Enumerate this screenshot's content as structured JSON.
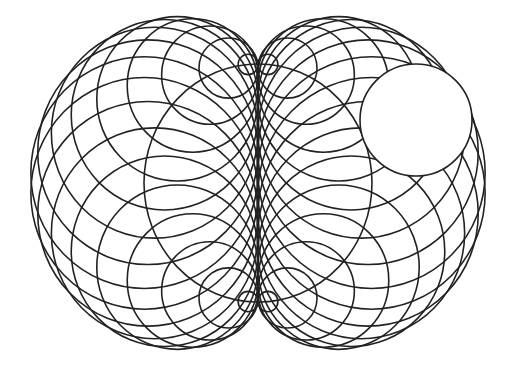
{
  "figure": {
    "type": "nephroid-circle-envelope",
    "canvas": {
      "width": 514,
      "height": 374,
      "background": "#ffffff"
    },
    "stroke_color": "#222222",
    "base_circle": {
      "cx": 258,
      "cy": 183,
      "rx": 114,
      "ry": 119
    },
    "generating_circles": {
      "count": 36,
      "start_angle_deg": 5
    },
    "highlight_circle": {
      "cx": 416,
      "cy": 120,
      "r": 56,
      "fill": "#ffffff"
    }
  }
}
